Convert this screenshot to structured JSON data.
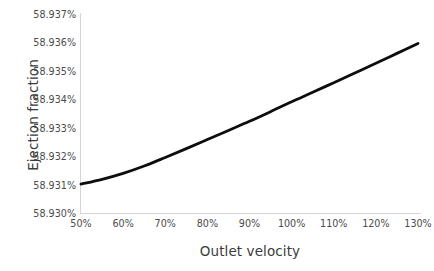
{
  "chart_data": {
    "type": "line",
    "title": "",
    "xlabel": "Outlet velocity",
    "ylabel": "Ejection fraction",
    "grid": false,
    "legend": false,
    "legend_position": "none",
    "series_color": "#0d0d0d",
    "axis_color": "#d4d4d4",
    "xlim": [
      50,
      130
    ],
    "ylim": [
      58.93,
      58.937
    ],
    "x_tick_labels": [
      "50%",
      "60%",
      "70%",
      "80%",
      "90%",
      "100%",
      "110%",
      "120%",
      "130%"
    ],
    "x_tick_values": [
      50,
      60,
      70,
      80,
      90,
      100,
      110,
      120,
      130
    ],
    "y_tick_labels": [
      "58.937%",
      "58.936%",
      "58.935%",
      "58.934%",
      "58.933%",
      "58.932%",
      "58.931%",
      "58.930%"
    ],
    "y_tick_values": [
      58.937,
      58.936,
      58.935,
      58.934,
      58.933,
      58.932,
      58.931,
      58.93
    ],
    "x": [
      50,
      55,
      60,
      65,
      70,
      75,
      80,
      85,
      90,
      95,
      100,
      105,
      110,
      115,
      120,
      125,
      130
    ],
    "values": [
      58.93105,
      58.93122,
      58.93143,
      58.93169,
      58.93199,
      58.9323,
      58.93262,
      58.93294,
      58.93326,
      58.9336,
      58.93395,
      58.93428,
      58.93462,
      58.93496,
      58.9353,
      58.93565,
      58.936
    ],
    "series": [
      {
        "name": "Ejection fraction",
        "values": [
          58.93105,
          58.93122,
          58.93143,
          58.93169,
          58.93199,
          58.9323,
          58.93262,
          58.93294,
          58.93326,
          58.9336,
          58.93395,
          58.93428,
          58.93462,
          58.93496,
          58.9353,
          58.93565,
          58.936
        ]
      }
    ]
  }
}
